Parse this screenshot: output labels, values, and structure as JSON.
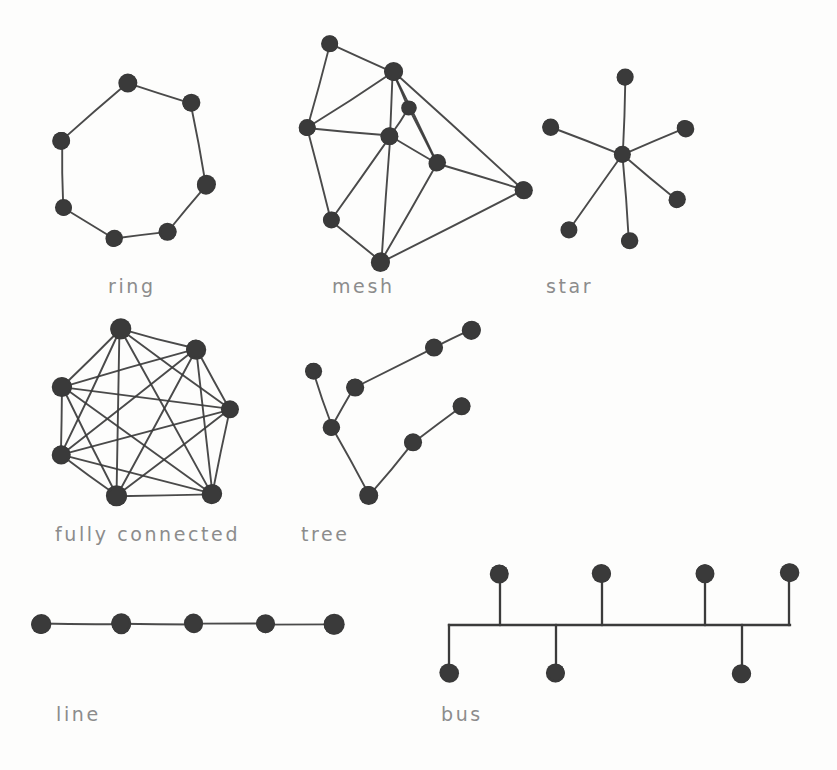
{
  "figure": {
    "style": "hand-drawn sketch",
    "ink_color": "#3a3a3a",
    "label_color": "#8c8c8c",
    "background_color": "#fdfdfc",
    "width": 837,
    "height": 770
  },
  "captions": [
    {
      "id": "ring",
      "text": "ring",
      "x": 108,
      "y": 276
    },
    {
      "id": "mesh",
      "text": "mesh",
      "x": 332,
      "y": 276
    },
    {
      "id": "star",
      "text": "star",
      "x": 546,
      "y": 276
    },
    {
      "id": "fully-connected",
      "text": "fully connected",
      "x": 55,
      "y": 524
    },
    {
      "id": "tree",
      "text": "tree",
      "x": 301,
      "y": 524
    },
    {
      "id": "line",
      "text": "line",
      "x": 56,
      "y": 704
    },
    {
      "id": "bus",
      "text": "bus",
      "x": 441,
      "y": 704
    }
  ],
  "chart_data": {
    "type": "diagram",
    "topologies": [
      {
        "name": "ring",
        "label": "ring",
        "node_count": 7,
        "edge_count": 7,
        "nodes": [
          {
            "id": 0,
            "x": 128,
            "y": 83,
            "r": 9.5
          },
          {
            "id": 1,
            "x": 191,
            "y": 103,
            "r": 9.0
          },
          {
            "id": 2,
            "x": 206,
            "y": 185,
            "r": 9.5
          },
          {
            "id": 3,
            "x": 168,
            "y": 232,
            "r": 9.0
          },
          {
            "id": 4,
            "x": 114,
            "y": 239,
            "r": 8.5
          },
          {
            "id": 5,
            "x": 63,
            "y": 207,
            "r": 8.5
          },
          {
            "id": 6,
            "x": 62,
            "y": 140,
            "r": 9.0
          }
        ],
        "edges": [
          [
            0,
            1
          ],
          [
            1,
            2
          ],
          [
            2,
            3
          ],
          [
            3,
            4
          ],
          [
            4,
            5
          ],
          [
            5,
            6
          ],
          [
            6,
            0
          ]
        ]
      },
      {
        "name": "mesh",
        "label": "mesh",
        "node_count": 8,
        "edge_count": 17,
        "nodes": [
          {
            "id": 0,
            "x": 330,
            "y": 44,
            "r": 8.5
          },
          {
            "id": 1,
            "x": 393,
            "y": 72,
            "r": 9.5
          },
          {
            "id": 2,
            "x": 409,
            "y": 108,
            "r": 7.5
          },
          {
            "id": 3,
            "x": 307,
            "y": 128,
            "r": 8.5
          },
          {
            "id": 4,
            "x": 390,
            "y": 136,
            "r": 9.0
          },
          {
            "id": 5,
            "x": 437,
            "y": 163,
            "r": 8.5
          },
          {
            "id": 6,
            "x": 523,
            "y": 190,
            "r": 9.0
          },
          {
            "id": 7,
            "x": 331,
            "y": 220,
            "r": 8.5
          },
          {
            "id": 8,
            "x": 381,
            "y": 262,
            "r": 9.5
          }
        ],
        "edges": [
          [
            0,
            1
          ],
          [
            0,
            3
          ],
          [
            1,
            3
          ],
          [
            1,
            2
          ],
          [
            1,
            4
          ],
          [
            1,
            5
          ],
          [
            1,
            6
          ],
          [
            2,
            4
          ],
          [
            2,
            5
          ],
          [
            3,
            4
          ],
          [
            3,
            7
          ],
          [
            4,
            5
          ],
          [
            4,
            7
          ],
          [
            4,
            8
          ],
          [
            5,
            6
          ],
          [
            5,
            8
          ],
          [
            6,
            8
          ],
          [
            7,
            8
          ]
        ]
      },
      {
        "name": "star",
        "label": "star",
        "node_count": 7,
        "edge_count": 6,
        "hub": 0,
        "nodes": [
          {
            "id": 0,
            "x": 623,
            "y": 155,
            "r": 8.5
          },
          {
            "id": 1,
            "x": 625,
            "y": 77,
            "r": 8.5
          },
          {
            "id": 2,
            "x": 550,
            "y": 127,
            "r": 8.5
          },
          {
            "id": 3,
            "x": 685,
            "y": 128,
            "r": 8.5
          },
          {
            "id": 4,
            "x": 677,
            "y": 200,
            "r": 8.5
          },
          {
            "id": 5,
            "x": 629,
            "y": 241,
            "r": 8.5
          },
          {
            "id": 6,
            "x": 569,
            "y": 229,
            "r": 8.5
          }
        ],
        "edges": [
          [
            0,
            1
          ],
          [
            0,
            2
          ],
          [
            0,
            3
          ],
          [
            0,
            4
          ],
          [
            0,
            5
          ],
          [
            0,
            6
          ]
        ]
      },
      {
        "name": "fully-connected",
        "label": "fully connected",
        "node_count": 7,
        "edge_count": 21,
        "nodes": [
          {
            "id": 0,
            "x": 120,
            "y": 329,
            "r": 10.5
          },
          {
            "id": 1,
            "x": 196,
            "y": 349,
            "r": 10.0
          },
          {
            "id": 2,
            "x": 230,
            "y": 409,
            "r": 9.0
          },
          {
            "id": 3,
            "x": 212,
            "y": 494,
            "r": 10.0
          },
          {
            "id": 4,
            "x": 117,
            "y": 496,
            "r": 10.5
          },
          {
            "id": 5,
            "x": 61,
            "y": 455,
            "r": 9.5
          },
          {
            "id": 6,
            "x": 62,
            "y": 387,
            "r": 10.0
          }
        ],
        "edges": [
          [
            0,
            1
          ],
          [
            0,
            2
          ],
          [
            0,
            3
          ],
          [
            0,
            4
          ],
          [
            0,
            5
          ],
          [
            0,
            6
          ],
          [
            1,
            2
          ],
          [
            1,
            3
          ],
          [
            1,
            4
          ],
          [
            1,
            5
          ],
          [
            1,
            6
          ],
          [
            2,
            3
          ],
          [
            2,
            4
          ],
          [
            2,
            5
          ],
          [
            2,
            6
          ],
          [
            3,
            4
          ],
          [
            3,
            5
          ],
          [
            3,
            6
          ],
          [
            4,
            5
          ],
          [
            4,
            6
          ],
          [
            5,
            6
          ]
        ]
      },
      {
        "name": "tree",
        "label": "tree",
        "node_count": 8,
        "edge_count": 7,
        "nodes": [
          {
            "id": 0,
            "x": 313,
            "y": 371,
            "r": 8.5
          },
          {
            "id": 1,
            "x": 332,
            "y": 427,
            "r": 8.5
          },
          {
            "id": 2,
            "x": 355,
            "y": 387,
            "r": 9.0
          },
          {
            "id": 3,
            "x": 434,
            "y": 348,
            "r": 9.0
          },
          {
            "id": 4,
            "x": 471,
            "y": 330,
            "r": 9.5
          },
          {
            "id": 5,
            "x": 369,
            "y": 495,
            "r": 9.5
          },
          {
            "id": 6,
            "x": 413,
            "y": 443,
            "r": 9.0
          },
          {
            "id": 7,
            "x": 462,
            "y": 406,
            "r": 9.0
          }
        ],
        "edges": [
          [
            0,
            1
          ],
          [
            1,
            2
          ],
          [
            2,
            3
          ],
          [
            3,
            4
          ],
          [
            1,
            5
          ],
          [
            5,
            6
          ],
          [
            6,
            7
          ]
        ]
      },
      {
        "name": "line",
        "label": "line",
        "node_count": 5,
        "edge_count": 4,
        "nodes": [
          {
            "id": 0,
            "x": 41,
            "y": 624,
            "r": 10.0
          },
          {
            "id": 1,
            "x": 121,
            "y": 624,
            "r": 10.0
          },
          {
            "id": 2,
            "x": 194,
            "y": 624,
            "r": 9.5
          },
          {
            "id": 3,
            "x": 265,
            "y": 624,
            "r": 9.5
          },
          {
            "id": 4,
            "x": 334,
            "y": 624,
            "r": 10.5
          }
        ],
        "edges": [
          [
            0,
            1
          ],
          [
            1,
            2
          ],
          [
            2,
            3
          ],
          [
            3,
            4
          ]
        ]
      },
      {
        "name": "bus",
        "label": "bus",
        "node_count": 7,
        "backbone": {
          "x1": 449,
          "x2": 790,
          "y": 625
        },
        "stubs_up": [
          {
            "id": 0,
            "x": 500,
            "y": 574,
            "r": 9.5
          },
          {
            "id": 1,
            "x": 602,
            "y": 573,
            "r": 9.5
          },
          {
            "id": 2,
            "x": 705,
            "y": 573,
            "r": 9.5
          },
          {
            "id": 3,
            "x": 789,
            "y": 573,
            "r": 9.5
          }
        ],
        "stubs_down": [
          {
            "id": 4,
            "x": 449,
            "y": 673,
            "r": 9.5
          },
          {
            "id": 5,
            "x": 556,
            "y": 673,
            "r": 9.5
          },
          {
            "id": 6,
            "x": 742,
            "y": 673,
            "r": 9.5
          }
        ]
      }
    ]
  }
}
